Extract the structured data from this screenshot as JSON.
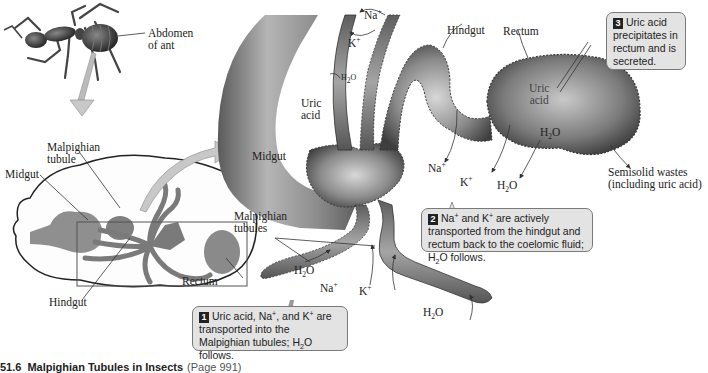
{
  "figure": {
    "caption_number": "51.6",
    "caption_title": "Malpighian Tubules in Insects",
    "caption_page": "(Page 991)"
  },
  "ant_view": {
    "abdomen_label_line1": "Abdomen",
    "abdomen_label_line2": "of ant"
  },
  "overview": {
    "malpighian_tubule_line1": "Malpighian",
    "malpighian_tubule_line2": "tubule",
    "midgut": "Midgut",
    "rectum": "Rectum",
    "hindgut": "Hindgut"
  },
  "detail": {
    "na_top": "Na",
    "k_top": "K",
    "h2o_top": "H",
    "uric_acid_line1": "Uric",
    "uric_acid_line2": "acid",
    "hindgut": "Hindgut",
    "rectum": "Rectum",
    "midgut": "Midgut",
    "rectum_uric_line1": "Uric",
    "rectum_uric_line2": "acid",
    "rectum_h2o": "H",
    "na_mid": "Na",
    "k_mid": "K",
    "h2o_mid": "H",
    "semisolid_line1": "Semisolid wastes",
    "semisolid_line2": "(including uric acid)",
    "malpighian_line1": "Malpighian",
    "malpighian_line2": "tubules",
    "h2o_tubule": "H",
    "na_bottom": "Na",
    "k_bottom": "K",
    "h2o_bottom": "H"
  },
  "chem": {
    "plus": "+",
    "two": "2",
    "o": "O"
  },
  "callouts": [
    {
      "number": "1",
      "text_a": "Uric acid, Na",
      "text_b": ", and K",
      "text_c": " are transported into the Malpighian tubules; H",
      "text_d": "O follows."
    },
    {
      "number": "2",
      "text_a": "Na",
      "text_b": " and K",
      "text_c": " are actively transported from the hindgut and rectum back to the coelomic fluid; H",
      "text_d": "O follows."
    },
    {
      "number": "3",
      "text": "Uric acid precipitates in rectum and is secreted."
    }
  ],
  "colors": {
    "callout_bg": "#e3e3e3",
    "badge_bg": "#222222",
    "tissue_dark": "#4a4a4a",
    "tissue_light": "#b8b8b8",
    "arrow_fill": "#c8c8c8"
  }
}
